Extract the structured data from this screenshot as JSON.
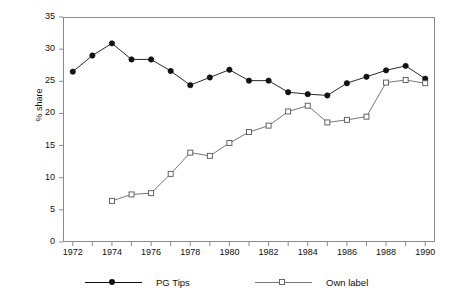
{
  "chart_data": {
    "type": "line",
    "title": "",
    "xlabel": "",
    "ylabel": "% share",
    "xlim": [
      1971.5,
      1990.5
    ],
    "ylim": [
      0,
      35
    ],
    "ytick_step": 5,
    "yticks": [
      0,
      5,
      10,
      15,
      20,
      25,
      30,
      35
    ],
    "xticks_minor": [
      1972,
      1973,
      1974,
      1975,
      1976,
      1977,
      1978,
      1979,
      1980,
      1981,
      1982,
      1983,
      1984,
      1985,
      1986,
      1987,
      1988,
      1989,
      1990
    ],
    "xtick_labels": [
      "1972",
      "1974",
      "1976",
      "1978",
      "1980",
      "1982",
      "1984",
      "1986",
      "1988",
      "1990"
    ],
    "xtick_label_values": [
      1972,
      1974,
      1976,
      1978,
      1980,
      1982,
      1984,
      1986,
      1988,
      1990
    ],
    "grid": false,
    "legend_position": "below",
    "x": [
      1972,
      1973,
      1974,
      1975,
      1976,
      1977,
      1978,
      1979,
      1980,
      1981,
      1982,
      1983,
      1984,
      1985,
      1986,
      1987,
      1988,
      1989,
      1990
    ],
    "series": [
      {
        "name": "PG Tips",
        "marker": "filled-circle",
        "color": "#111111",
        "x": [
          1972,
          1973,
          1974,
          1975,
          1976,
          1977,
          1978,
          1979,
          1980,
          1981,
          1982,
          1983,
          1984,
          1985,
          1986,
          1987,
          1988,
          1989,
          1990
        ],
        "values": [
          26.5,
          29.0,
          30.9,
          28.4,
          28.4,
          26.6,
          24.4,
          25.6,
          26.8,
          25.1,
          25.1,
          23.3,
          23.0,
          22.8,
          24.7,
          25.7,
          26.7,
          27.4,
          25.4
        ]
      },
      {
        "name": "Own label",
        "marker": "open-square",
        "color": "#666666",
        "x": [
          1974,
          1975,
          1976,
          1977,
          1978,
          1979,
          1980,
          1981,
          1982,
          1983,
          1984,
          1985,
          1986,
          1987,
          1988,
          1989,
          1990
        ],
        "values": [
          6.4,
          7.4,
          7.6,
          10.6,
          13.9,
          13.4,
          15.4,
          17.1,
          18.1,
          20.3,
          21.2,
          18.6,
          19.0,
          19.5,
          24.8,
          25.2,
          24.7
        ]
      }
    ]
  },
  "legend": {
    "entries": [
      {
        "label": "PG Tips"
      },
      {
        "label": "Own label"
      }
    ]
  },
  "axes": {
    "y_title": "% share"
  }
}
